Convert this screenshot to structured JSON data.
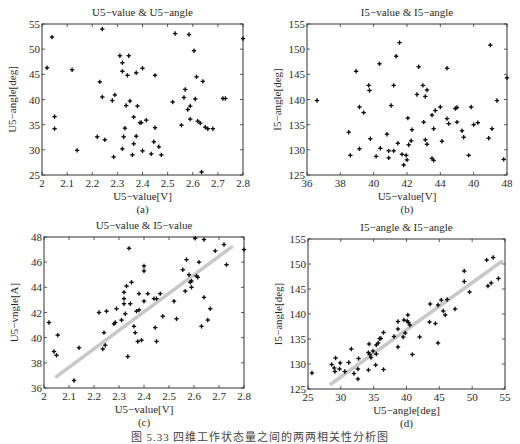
{
  "figure": {
    "caption": "图 5.33  四维工作状态量之间的两两相关性分析图"
  },
  "chart_data": [
    {
      "type": "scatter",
      "panel": "a",
      "panel_label": "(a)",
      "title": "U5−value & U5−angle",
      "xlabel": "U5−value[V]",
      "ylabel": "U5−angle[deg]",
      "xlim": [
        2,
        2.8
      ],
      "ylim": [
        25,
        55
      ],
      "xticks": [
        2,
        2.1,
        2.2,
        2.3,
        2.4,
        2.5,
        2.6,
        2.7,
        2.8
      ],
      "xtick_labels": [
        "2",
        "2.1",
        "2.2",
        "2.3",
        "2.4",
        "2.5",
        "2.6",
        "2.7",
        "2.8"
      ],
      "yticks": [
        25,
        30,
        35,
        40,
        45,
        50,
        55
      ],
      "ytick_labels": [
        "25",
        "30",
        "35",
        "40",
        "45",
        "50",
        "55"
      ],
      "grid": false,
      "trendline": null,
      "points": [
        [
          2.02,
          46.3
        ],
        [
          2.04,
          52.4
        ],
        [
          2.05,
          36.6
        ],
        [
          2.05,
          34.2
        ],
        [
          2.12,
          45.9
        ],
        [
          2.14,
          29.9
        ],
        [
          2.22,
          32.6
        ],
        [
          2.23,
          43.5
        ],
        [
          2.24,
          54.0
        ],
        [
          2.24,
          40.5
        ],
        [
          2.25,
          32.0
        ],
        [
          2.28,
          39.8
        ],
        [
          2.29,
          40.9
        ],
        [
          2.285,
          28.6
        ],
        [
          2.31,
          48.7
        ],
        [
          2.32,
          47.3
        ],
        [
          2.32,
          45.6
        ],
        [
          2.32,
          30.2
        ],
        [
          2.325,
          32.6
        ],
        [
          2.33,
          34.3
        ],
        [
          2.335,
          38.8
        ],
        [
          2.34,
          44.8
        ],
        [
          2.345,
          48.7
        ],
        [
          2.35,
          39.7
        ],
        [
          2.36,
          29.0
        ],
        [
          2.365,
          36.5
        ],
        [
          2.365,
          31.2
        ],
        [
          2.375,
          45.3
        ],
        [
          2.375,
          32.7
        ],
        [
          2.38,
          38.7
        ],
        [
          2.39,
          35.4
        ],
        [
          2.395,
          35.4
        ],
        [
          2.4,
          46.2
        ],
        [
          2.4,
          29.8
        ],
        [
          2.415,
          35.9
        ],
        [
          2.435,
          29.2
        ],
        [
          2.445,
          31.6
        ],
        [
          2.45,
          44.8
        ],
        [
          2.45,
          34.4
        ],
        [
          2.465,
          30.6
        ],
        [
          2.475,
          29.0
        ],
        [
          2.52,
          39.5
        ],
        [
          2.53,
          53.1
        ],
        [
          2.555,
          34.9
        ],
        [
          2.565,
          40.4
        ],
        [
          2.57,
          42.0
        ],
        [
          2.58,
          38.0
        ],
        [
          2.585,
          52.9
        ],
        [
          2.59,
          38.7
        ],
        [
          2.59,
          36.1
        ],
        [
          2.605,
          49.7
        ],
        [
          2.61,
          40.1
        ],
        [
          2.615,
          44.5
        ],
        [
          2.62,
          35.7
        ],
        [
          2.63,
          35.3
        ],
        [
          2.64,
          43.6
        ],
        [
          2.635,
          25.6
        ],
        [
          2.65,
          34.5
        ],
        [
          2.66,
          34.2
        ],
        [
          2.68,
          34.2
        ],
        [
          2.72,
          40.2
        ],
        [
          2.73,
          40.2
        ],
        [
          2.8,
          52.1
        ]
      ]
    },
    {
      "type": "scatter",
      "panel": "b",
      "panel_label": "(b)",
      "title": "I5−value & I5−angle",
      "xlabel": "U5−value[V]",
      "ylabel": "I5−angle[deg]",
      "xlim": [
        36,
        48
      ],
      "ylim": [
        125,
        155
      ],
      "xticks": [
        36,
        38,
        40,
        42,
        44,
        46,
        48
      ],
      "xtick_labels": [
        "36",
        "38",
        "40",
        "42",
        "44",
        "40",
        "48"
      ],
      "yticks": [
        125,
        130,
        135,
        140,
        145,
        150,
        155
      ],
      "ytick_labels": [
        "125",
        "130",
        "135",
        "140",
        "145",
        "150",
        "155"
      ],
      "grid": false,
      "trendline": null,
      "points": [
        [
          36.6,
          139.8
        ],
        [
          38.5,
          133.5
        ],
        [
          38.6,
          128.9
        ],
        [
          38.95,
          145.6
        ],
        [
          39.15,
          138.5
        ],
        [
          39.15,
          130.2
        ],
        [
          39.4,
          137.4
        ],
        [
          39.7,
          142.8
        ],
        [
          39.75,
          141.8
        ],
        [
          39.8,
          132.2
        ],
        [
          40.35,
          147.1
        ],
        [
          40.4,
          130.3
        ],
        [
          40.15,
          128.7
        ],
        [
          40.8,
          133.1
        ],
        [
          40.9,
          129.8
        ],
        [
          40.9,
          128.4
        ],
        [
          41.05,
          138.8
        ],
        [
          41.2,
          129.8
        ],
        [
          41.2,
          142.8
        ],
        [
          41.35,
          148.6
        ],
        [
          41.45,
          131.3
        ],
        [
          41.55,
          151.3
        ],
        [
          41.7,
          129.1
        ],
        [
          41.8,
          127.0
        ],
        [
          41.95,
          128.9
        ],
        [
          42.0,
          128.0
        ],
        [
          42.05,
          136.3
        ],
        [
          42.1,
          131.0
        ],
        [
          42.25,
          131.8
        ],
        [
          42.3,
          134.0
        ],
        [
          42.6,
          141.0
        ],
        [
          42.7,
          146.5
        ],
        [
          42.95,
          142.8
        ],
        [
          43.0,
          135.5
        ],
        [
          43.1,
          140.6
        ],
        [
          43.1,
          132.0
        ],
        [
          43.2,
          131.1
        ],
        [
          43.2,
          141.9
        ],
        [
          43.5,
          136.9
        ],
        [
          43.5,
          128.3
        ],
        [
          43.6,
          134.2
        ],
        [
          43.6,
          127.9
        ],
        [
          43.7,
          137.8
        ],
        [
          44.0,
          138.5
        ],
        [
          44.1,
          131.7
        ],
        [
          44.4,
          146.2
        ],
        [
          44.4,
          136.2
        ],
        [
          44.5,
          135.2
        ],
        [
          44.9,
          138.2
        ],
        [
          45.0,
          138.4
        ],
        [
          45.0,
          135.5
        ],
        [
          45.3,
          133.8
        ],
        [
          45.4,
          132.5
        ],
        [
          45.7,
          128.9
        ],
        [
          45.85,
          138.5
        ],
        [
          46.0,
          135.0
        ],
        [
          46.25,
          135.4
        ],
        [
          46.9,
          132.3
        ],
        [
          47.0,
          150.8
        ],
        [
          47.1,
          134.2
        ],
        [
          47.4,
          139.8
        ],
        [
          47.8,
          128.1
        ],
        [
          48.0,
          144.3
        ]
      ]
    },
    {
      "type": "scatter",
      "panel": "c",
      "panel_label": "(c)",
      "title": "U5−value & I5−value",
      "xlabel": "U5−value[V]",
      "ylabel": "U5−vngle[A]",
      "xlim": [
        2,
        2.8
      ],
      "ylim": [
        36,
        48
      ],
      "xticks": [
        2,
        2.1,
        2.2,
        2.3,
        2.4,
        2.5,
        2.6,
        2.7,
        2.8
      ],
      "xtick_labels": [
        "2",
        "2.1",
        "2.2",
        "2.3",
        "2.4",
        "2.5",
        "2.6",
        "2.7",
        "2.8"
      ],
      "yticks": [
        36,
        38,
        40,
        42,
        44,
        46,
        48
      ],
      "ytick_labels": [
        "36",
        "38",
        "40",
        "42",
        "44",
        "46",
        "48"
      ],
      "grid": false,
      "trendline": {
        "x0": 2.05,
        "y0": 36.9,
        "x1": 2.75,
        "y1": 47.2,
        "color": "#c8c8c8"
      },
      "points": [
        [
          2.02,
          41.2
        ],
        [
          2.04,
          38.9
        ],
        [
          2.05,
          38.6
        ],
        [
          2.055,
          40.2
        ],
        [
          2.12,
          36.6
        ],
        [
          2.14,
          39.2
        ],
        [
          2.22,
          42.0
        ],
        [
          2.235,
          39.1
        ],
        [
          2.24,
          40.4
        ],
        [
          2.245,
          39.4
        ],
        [
          2.25,
          42.1
        ],
        [
          2.28,
          41.1
        ],
        [
          2.285,
          41.2
        ],
        [
          2.29,
          42.3
        ],
        [
          2.31,
          41.4
        ],
        [
          2.32,
          43.6
        ],
        [
          2.32,
          43.1
        ],
        [
          2.32,
          42.7
        ],
        [
          2.325,
          41.9
        ],
        [
          2.33,
          44.1
        ],
        [
          2.335,
          38.5
        ],
        [
          2.34,
          47.1
        ],
        [
          2.345,
          42.7
        ],
        [
          2.35,
          44.4
        ],
        [
          2.36,
          40.9
        ],
        [
          2.365,
          40.4
        ],
        [
          2.37,
          42.1
        ],
        [
          2.375,
          39.7
        ],
        [
          2.38,
          42.2
        ],
        [
          2.38,
          43.5
        ],
        [
          2.39,
          39.8
        ],
        [
          2.4,
          45.7
        ],
        [
          2.4,
          45.3
        ],
        [
          2.4,
          42.9
        ],
        [
          2.415,
          43.5
        ],
        [
          2.44,
          43.1
        ],
        [
          2.445,
          40.8
        ],
        [
          2.45,
          43.1
        ],
        [
          2.45,
          39.7
        ],
        [
          2.465,
          43.5
        ],
        [
          2.475,
          41.7
        ],
        [
          2.52,
          42.9
        ],
        [
          2.53,
          41.5
        ],
        [
          2.555,
          45.4
        ],
        [
          2.565,
          43.7
        ],
        [
          2.57,
          46.2
        ],
        [
          2.58,
          45.0
        ],
        [
          2.585,
          44.4
        ],
        [
          2.59,
          44.5
        ],
        [
          2.59,
          44.0
        ],
        [
          2.605,
          47.9
        ],
        [
          2.61,
          44.9
        ],
        [
          2.615,
          44.8
        ],
        [
          2.62,
          46.0
        ],
        [
          2.63,
          40.9
        ],
        [
          2.64,
          47.8
        ],
        [
          2.64,
          43.2
        ],
        [
          2.655,
          41.4
        ],
        [
          2.665,
          42.3
        ],
        [
          2.685,
          46.9
        ],
        [
          2.72,
          47.4
        ],
        [
          2.73,
          45.8
        ],
        [
          2.8,
          47.0
        ]
      ]
    },
    {
      "type": "scatter",
      "panel": "d",
      "panel_label": "(d)",
      "title": "I5−angle & I5−angle",
      "xlabel": "U5−angle[deg]",
      "ylabel": "I5−angle[deg]",
      "xlim": [
        25,
        55
      ],
      "ylim": [
        125,
        155
      ],
      "xticks": [
        25,
        30,
        35,
        40,
        45,
        50,
        55
      ],
      "xtick_labels": [
        "25",
        "30",
        "35",
        "40",
        "45",
        "50",
        "55"
      ],
      "yticks": [
        125,
        130,
        135,
        140,
        145,
        150,
        155
      ],
      "ytick_labels": [
        "125",
        "130",
        "135",
        "140",
        "145",
        "150",
        "155"
      ],
      "grid": false,
      "trendline": {
        "x0": 28.5,
        "y0": 126.0,
        "x1": 54.5,
        "y1": 150.5,
        "color": "#c8c8c8"
      },
      "points": [
        [
          25.6,
          128.2
        ],
        [
          28.6,
          129.9
        ],
        [
          29.0,
          129.2
        ],
        [
          29.1,
          128.5
        ],
        [
          29.2,
          131.2
        ],
        [
          29.8,
          129.0
        ],
        [
          29.9,
          130.2
        ],
        [
          30.6,
          128.5
        ],
        [
          31.2,
          130.3
        ],
        [
          31.6,
          133.0
        ],
        [
          32.0,
          128.1
        ],
        [
          32.6,
          129.0
        ],
        [
          32.6,
          127.0
        ],
        [
          32.7,
          131.1
        ],
        [
          34.2,
          128.8
        ],
        [
          34.2,
          132.3
        ],
        [
          34.3,
          134.0
        ],
        [
          34.4,
          131.9
        ],
        [
          34.6,
          131.3
        ],
        [
          34.9,
          132.6
        ],
        [
          35.3,
          129.8
        ],
        [
          35.4,
          132.0
        ],
        [
          35.4,
          133.8
        ],
        [
          35.7,
          134.2
        ],
        [
          35.9,
          135.1
        ],
        [
          36.1,
          135.1
        ],
        [
          36.5,
          136.3
        ],
        [
          36.5,
          128.9
        ],
        [
          38.1,
          135.5
        ],
        [
          38.7,
          138.5
        ],
        [
          38.7,
          137.0
        ],
        [
          38.7,
          133.4
        ],
        [
          39.5,
          135.4
        ],
        [
          39.6,
          138.8
        ],
        [
          39.8,
          136.2
        ],
        [
          40.1,
          138.6
        ],
        [
          40.2,
          139.8
        ],
        [
          40.3,
          138.3
        ],
        [
          40.5,
          137.8
        ],
        [
          40.9,
          131.9
        ],
        [
          42.0,
          135.4
        ],
        [
          43.5,
          138.4
        ],
        [
          43.6,
          142.0
        ],
        [
          44.4,
          138.1
        ],
        [
          44.8,
          141.8
        ],
        [
          44.8,
          134.2
        ],
        [
          45.3,
          142.8
        ],
        [
          45.6,
          140.6
        ],
        [
          45.9,
          139.8
        ],
        [
          46.2,
          142.9
        ],
        [
          47.4,
          141.0
        ],
        [
          48.8,
          148.6
        ],
        [
          48.8,
          146.5
        ],
        [
          49.6,
          144.4
        ],
        [
          52.2,
          150.8
        ],
        [
          52.4,
          145.6
        ],
        [
          52.9,
          146.2
        ],
        [
          53.2,
          151.3
        ],
        [
          54.0,
          147.1
        ]
      ]
    }
  ]
}
